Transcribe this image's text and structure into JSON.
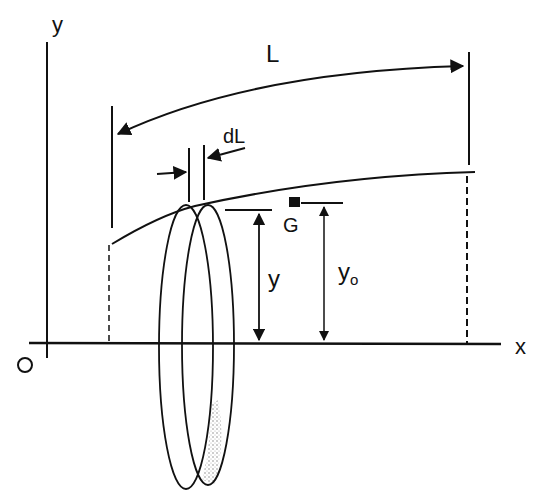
{
  "diagram": {
    "title": "",
    "labels": {
      "y_axis": "y",
      "x_axis": "x",
      "origin": "O",
      "length": "L",
      "element_length": "dL",
      "centroid": "G",
      "height_y": "y",
      "height_y0": "y",
      "height_y0_subscript": "o"
    },
    "colors": {
      "ink": "#111111",
      "background": "#ffffff",
      "shading": "#9a9a9a"
    }
  }
}
